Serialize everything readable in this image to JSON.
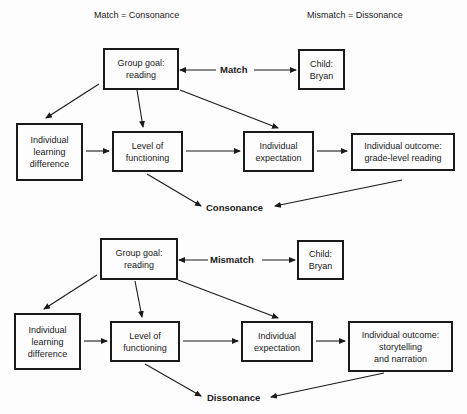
{
  "headers": {
    "left": "Match = Consonance",
    "right": "Mismatch = Dissonance"
  },
  "diagrams": [
    {
      "name": "consonance",
      "group_goal": [
        "Group goal:",
        "reading"
      ],
      "relation_label": "Match",
      "child": [
        "Child:",
        "Bryan"
      ],
      "learning_difference": [
        "Individual",
        "learning",
        "difference"
      ],
      "level_of_functioning": [
        "Level of",
        "functioning"
      ],
      "individual_expectation": [
        "Individual",
        "expectation"
      ],
      "individual_outcome": [
        "Individual outcome:",
        "grade-level reading"
      ],
      "result": "Consonance"
    },
    {
      "name": "dissonance",
      "group_goal": [
        "Group goal:",
        "reading"
      ],
      "relation_label": "Mismatch",
      "child": [
        "Child:",
        "Bryan"
      ],
      "learning_difference": [
        "Individual",
        "learning",
        "difference"
      ],
      "level_of_functioning": [
        "Level of",
        "functioning"
      ],
      "individual_expectation": [
        "Individual",
        "expectation"
      ],
      "individual_outcome": [
        "Individual outcome:",
        "storytelling",
        "and narration"
      ],
      "result": "Dissonance"
    }
  ],
  "colors": {
    "ink": "#1a1a1a",
    "background": "#fdfdfd"
  }
}
